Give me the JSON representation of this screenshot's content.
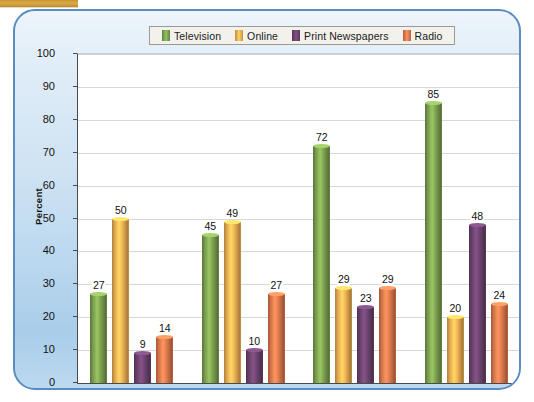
{
  "chart_data": {
    "type": "bar",
    "title": "",
    "xlabel": "",
    "ylabel": "Percent",
    "ylim": [
      0,
      100
    ],
    "ytick_step": 10,
    "yticks": [
      0,
      10,
      20,
      30,
      40,
      50,
      60,
      70,
      80,
      90,
      100
    ],
    "grid": true,
    "legend_position": "top-center",
    "categories": [
      "Age 18–29",
      "Age 30–49",
      "Age 50–64",
      "Age 65+"
    ],
    "series": [
      {
        "name": "Television",
        "color": "#7fa352",
        "values": [
          27,
          45,
          72,
          85
        ]
      },
      {
        "name": "Online",
        "color": "#f0b254",
        "values": [
          50,
          49,
          29,
          20
        ]
      },
      {
        "name": "Print Newspapers",
        "color": "#6e4470",
        "values": [
          9,
          10,
          23,
          48
        ]
      },
      {
        "name": "Radio",
        "color": "#e07b4f",
        "values": [
          14,
          27,
          29,
          24
        ]
      }
    ]
  },
  "legend": {
    "entries": [
      {
        "label": "Television"
      },
      {
        "label": "Online"
      },
      {
        "label": "Print Newspapers"
      },
      {
        "label": "Radio"
      }
    ]
  },
  "colors": {
    "panel_border": "#5a8cc0",
    "plot_background": "#ffffff",
    "gridline": "#d8d8d8",
    "axis": "#4a4a4a",
    "tab_gold": "#d9ab4b"
  }
}
